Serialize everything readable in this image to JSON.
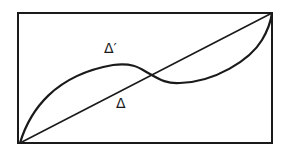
{
  "diagram": {
    "frame": {
      "x1": 18,
      "y1": 13,
      "x2": 272,
      "y2": 143
    },
    "stroke_color": "#1a1a1a",
    "background": "#ffffff",
    "labels": {
      "curve": "Δ′",
      "line": "Δ"
    },
    "curve_label_pos": {
      "x": 104,
      "y": 41
    },
    "line_label_pos": {
      "x": 116,
      "y": 96
    },
    "elements": [
      {
        "name": "straight-line",
        "label": "Δ",
        "from": [
          20,
          143
        ],
        "to": [
          272,
          13
        ]
      },
      {
        "name": "s-curve",
        "label": "Δ′",
        "from": [
          20,
          143
        ],
        "to": [
          272,
          13
        ],
        "passes_through": [
          [
            113,
            65
          ],
          [
            150,
            74
          ],
          [
            180,
            83
          ]
        ]
      }
    ]
  }
}
